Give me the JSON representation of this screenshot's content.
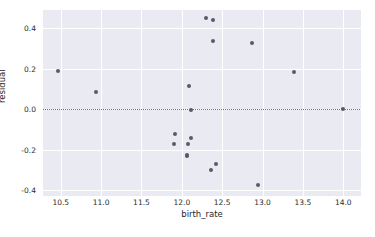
{
  "chart_data": {
    "type": "scatter",
    "title": "",
    "xlabel": "birth_rate",
    "ylabel": "residual",
    "xlim": [
      10.28,
      14.22
    ],
    "ylim": [
      -0.43,
      0.49
    ],
    "xticks": [
      "10.5",
      "11.0",
      "11.5",
      "12.0",
      "12.5",
      "13.0",
      "13.5",
      "14.0"
    ],
    "xtick_values": [
      10.5,
      11.0,
      11.5,
      12.0,
      12.5,
      13.0,
      13.5,
      14.0
    ],
    "yticks": [
      "0.4",
      "0.2",
      "0.0",
      "-0.2",
      "-0.4"
    ],
    "ytick_values": [
      0.4,
      0.2,
      0.0,
      -0.2,
      -0.4
    ],
    "grid": true,
    "legend": null,
    "reference_line": {
      "type": "horizontal",
      "y": 0.0,
      "style": "dotted",
      "color": "#6f6f7a"
    },
    "marker_color": "#5a5a64",
    "background_color": "#eaeaf2",
    "grid_color": "#ffffff",
    "x": [
      10.46,
      10.94,
      11.9,
      11.92,
      12.06,
      12.08,
      12.09,
      12.11,
      12.11,
      12.3,
      12.36,
      12.39,
      12.39,
      12.42,
      12.87,
      12.94,
      13.39,
      14.0
    ],
    "y": [
      0.19,
      0.086,
      -0.172,
      -0.125,
      -0.225,
      -0.175,
      0.115,
      -0.145,
      -0.005,
      0.45,
      -0.3,
      0.44,
      0.335,
      -0.27,
      0.325,
      -0.378,
      0.185,
      0.0
    ],
    "points": [
      {
        "x": 10.46,
        "y": 0.19
      },
      {
        "x": 10.94,
        "y": 0.086
      },
      {
        "x": 11.9,
        "y": -0.172
      },
      {
        "x": 11.92,
        "y": -0.125
      },
      {
        "x": 12.06,
        "y": -0.225
      },
      {
        "x": 12.06,
        "y": -0.232
      },
      {
        "x": 12.08,
        "y": -0.175
      },
      {
        "x": 12.09,
        "y": 0.115
      },
      {
        "x": 12.11,
        "y": -0.145
      },
      {
        "x": 12.11,
        "y": -0.005
      },
      {
        "x": 12.3,
        "y": 0.45
      },
      {
        "x": 12.36,
        "y": -0.3
      },
      {
        "x": 12.39,
        "y": 0.44
      },
      {
        "x": 12.39,
        "y": 0.335
      },
      {
        "x": 12.42,
        "y": -0.27
      },
      {
        "x": 12.87,
        "y": 0.325
      },
      {
        "x": 12.94,
        "y": -0.378
      },
      {
        "x": 13.39,
        "y": 0.185
      },
      {
        "x": 14.0,
        "y": 0.0
      }
    ]
  }
}
